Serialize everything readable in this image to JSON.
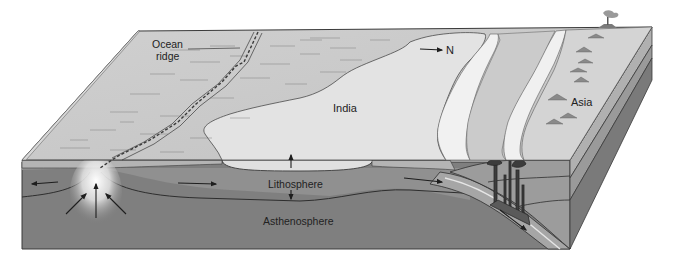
{
  "diagram": {
    "type": "block-diagram",
    "labels": {
      "ocean_ridge_line1": "Ocean",
      "ocean_ridge_line2": "ridge",
      "north": "N",
      "india": "India",
      "asia": "Asia",
      "lithosphere": "Lithosphere",
      "asthenosphere": "Asthenosphere"
    },
    "colors": {
      "background": "#ffffff",
      "ocean_floor": "#c9c9c9",
      "continent_india": "#e4e4e4",
      "continent_asia": "#d2d2d2",
      "shelf_white": "#f2f2f2",
      "lithosphere": "#8f8f8f",
      "asthenosphere": "#7d7d7d",
      "side_face": "#9a9a9a",
      "side_dark": "#6f6f6f",
      "upwelling_glow": "#ffffff",
      "outline": "#3a3a3a"
    }
  }
}
